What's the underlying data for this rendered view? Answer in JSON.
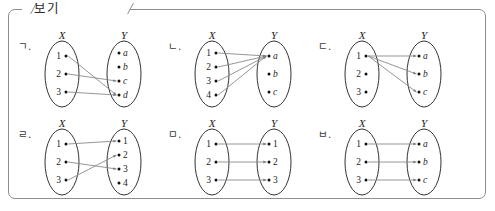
{
  "legend": {
    "text": "보기"
  },
  "colors": {
    "border": "#8d8d8d",
    "ink": "#1c1c1c",
    "arrow": "#8a8a8a",
    "background": "#ffffff"
  },
  "panels": [
    {
      "label": "ㄱ.",
      "domain_name": "X",
      "codomain_name": "Y",
      "domain_elements": [
        "1",
        "2",
        "3"
      ],
      "codomain_elements": [
        "a",
        "b",
        "c",
        "d"
      ],
      "codomain_italic": true,
      "arrows": [
        {
          "from": "1",
          "to": "d"
        },
        {
          "from": "2",
          "to": "c"
        },
        {
          "from": "3",
          "to": "d"
        }
      ]
    },
    {
      "label": "ㄴ.",
      "domain_name": "X",
      "codomain_name": "Y",
      "domain_elements": [
        "1",
        "2",
        "3",
        "4"
      ],
      "codomain_elements": [
        "a",
        "b",
        "c"
      ],
      "codomain_italic": true,
      "arrows": [
        {
          "from": "1",
          "to": "a"
        },
        {
          "from": "2",
          "to": "a"
        },
        {
          "from": "3",
          "to": "a"
        },
        {
          "from": "4",
          "to": "a"
        }
      ]
    },
    {
      "label": "ㄷ.",
      "domain_name": "X",
      "codomain_name": "Y",
      "domain_elements": [
        "1",
        "2",
        "3"
      ],
      "codomain_elements": [
        "a",
        "b",
        "c"
      ],
      "codomain_italic": true,
      "arrows": [
        {
          "from": "1",
          "to": "a"
        },
        {
          "from": "1",
          "to": "b"
        },
        {
          "from": "1",
          "to": "c"
        }
      ]
    },
    {
      "label": "ㄹ.",
      "domain_name": "X",
      "codomain_name": "Y",
      "domain_elements": [
        "1",
        "2",
        "3"
      ],
      "codomain_elements": [
        "1",
        "2",
        "3",
        "4"
      ],
      "codomain_italic": false,
      "arrows": [
        {
          "from": "1",
          "to": "1"
        },
        {
          "from": "2",
          "to": "3"
        },
        {
          "from": "3",
          "to": "2"
        }
      ]
    },
    {
      "label": "ㅁ.",
      "domain_name": "X",
      "codomain_name": "Y",
      "domain_elements": [
        "1",
        "2",
        "3"
      ],
      "codomain_elements": [
        "1",
        "2",
        "3"
      ],
      "codomain_italic": false,
      "arrows": [
        {
          "from": "1",
          "to": "1"
        },
        {
          "from": "2",
          "to": "2"
        },
        {
          "from": "3",
          "to": "3"
        }
      ]
    },
    {
      "label": "ㅂ.",
      "domain_name": "X",
      "codomain_name": "Y",
      "domain_elements": [
        "1",
        "2",
        "3"
      ],
      "codomain_elements": [
        "a",
        "b",
        "c"
      ],
      "codomain_italic": true,
      "arrows": [
        {
          "from": "1",
          "to": "a"
        },
        {
          "from": "2",
          "to": "b"
        },
        {
          "from": "3",
          "to": "c"
        }
      ]
    }
  ]
}
